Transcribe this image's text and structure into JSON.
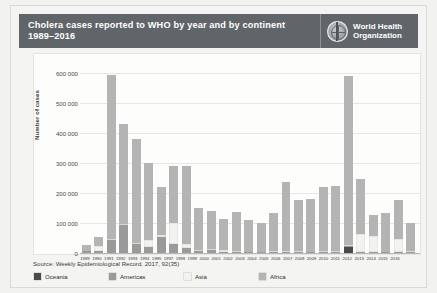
{
  "header": {
    "title_line1": "Cholera cases reported to WHO by year and by continent",
    "title_line2": "1989–2016",
    "logo_line1": "World Health",
    "logo_line2": "Organization",
    "logo_icon": "who-globe-emblem",
    "bg_color": "#5f6569"
  },
  "source_note": "Source: Weekly Epidemiological Record, 2017, 92(35)",
  "legend": {
    "items": [
      {
        "label": "Oceania",
        "color": "#4a4a4a"
      },
      {
        "label": "Americas",
        "color": "#9a9a9a"
      },
      {
        "label": "Asia",
        "color": "#f2f2f0"
      },
      {
        "label": "Africa",
        "color": "#b4b4b4"
      }
    ]
  },
  "chart_data": {
    "type": "bar",
    "stacked": true,
    "title": "Cholera cases reported to WHO by year and by continent 1989–2016",
    "xlabel": "",
    "ylabel": "Number of cases",
    "ylim": [
      0,
      650000
    ],
    "yticks": [
      0,
      100000,
      200000,
      300000,
      400000,
      500000,
      600000
    ],
    "ytick_labels": [
      "0",
      "100 000",
      "200 000",
      "300 000",
      "400 000",
      "500 000",
      "600 000"
    ],
    "grid": true,
    "legend_position": "bottom",
    "categories": [
      "1989",
      "1990",
      "1991",
      "1992",
      "1993",
      "1994",
      "1995",
      "1997",
      "1998",
      "1999",
      "2000",
      "2001",
      "2002",
      "2003",
      "2004",
      "2005",
      "2006",
      "2007",
      "2008",
      "2009",
      "2010",
      "2011",
      "2012",
      "2013",
      "2014",
      "2015",
      "2016"
    ],
    "series": [
      {
        "name": "Oceania",
        "color": "#4a4a4a",
        "values": [
          0,
          0,
          0,
          0,
          0,
          0,
          0,
          0,
          0,
          0,
          0,
          0,
          0,
          0,
          0,
          0,
          0,
          0,
          0,
          0,
          0,
          20000,
          0,
          0,
          0,
          0,
          0
        ]
      },
      {
        "name": "Americas",
        "color": "#9a9a9a",
        "values": [
          6000,
          8000,
          45000,
          95000,
          30000,
          20000,
          55000,
          30000,
          18000,
          8000,
          10000,
          4000,
          500,
          100,
          100,
          100,
          100,
          100,
          100,
          100,
          100,
          500,
          100,
          100,
          100,
          100,
          100
        ]
      },
      {
        "name": "Asia",
        "color": "#f2f2f0",
        "values": [
          2000,
          16000,
          3000,
          3000,
          5000,
          22000,
          5000,
          70000,
          12000,
          3000,
          4000,
          6000,
          4000,
          3000,
          3000,
          5000,
          4000,
          6000,
          3000,
          4000,
          5000,
          4000,
          60000,
          55000,
          3000,
          45000,
          4000
        ]
      },
      {
        "name": "Africa",
        "color": "#b4b4b4",
        "values": [
          18000,
          28000,
          547000,
          332000,
          345000,
          258000,
          160000,
          190000,
          260000,
          140000,
          125000,
          105000,
          130000,
          105000,
          95000,
          125000,
          230000,
          170000,
          175000,
          215000,
          215000,
          565000,
          185000,
          70000,
          130000,
          130000,
          95000
        ]
      }
    ],
    "totals": [
      26000,
      52000,
      595000,
      430000,
      380000,
      300000,
      220000,
      290000,
      290000,
      151000,
      139000,
      115000,
      134500,
      108100,
      98100,
      130100,
      234100,
      176100,
      178100,
      219100,
      220100,
      589500,
      245100,
      125100,
      133100,
      175100,
      99100
    ]
  }
}
